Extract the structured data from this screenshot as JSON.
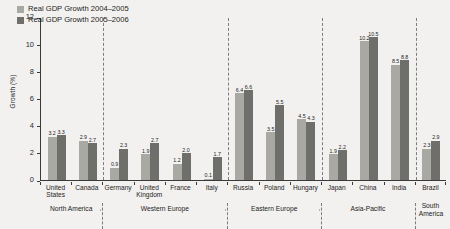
{
  "chart_data": {
    "type": "bar",
    "title": "",
    "xlabel": "",
    "ylabel": "Growth (%)",
    "ylim": [
      0,
      12
    ],
    "yticks": [
      "0",
      "2",
      "4",
      "6",
      "8",
      "10",
      "12"
    ],
    "grid": false,
    "legend_position": "top-left",
    "categories": [
      "United States",
      "Canada",
      "Germany",
      "United Kingdom",
      "France",
      "Italy",
      "Russia",
      "Poland",
      "Hungary",
      "Japan",
      "China",
      "India",
      "Brazil"
    ],
    "series": [
      {
        "name": "Real GDP Growth 2004-2005",
        "color": "#a9a9a4",
        "values": [
          3.2,
          2.9,
          0.9,
          1.9,
          1.2,
          0.1,
          6.4,
          3.5,
          4.5,
          1.9,
          10.2,
          8.5,
          2.3
        ]
      },
      {
        "name": "Real GDP Growth 2005-2006",
        "color": "#6e6e6b",
        "values": [
          3.3,
          2.7,
          2.3,
          2.7,
          2.0,
          1.7,
          6.6,
          5.5,
          4.3,
          2.2,
          10.5,
          8.8,
          2.9
        ]
      }
    ],
    "groups": [
      {
        "label": "North America",
        "count": 2
      },
      {
        "label": "Western Europe",
        "count": 4
      },
      {
        "label": "Eastern Europe",
        "count": 3
      },
      {
        "label": "Asia-Pacific",
        "count": 3
      },
      {
        "label": "South America",
        "count": 1
      }
    ]
  },
  "legend": {
    "items": [
      {
        "label": "Real GDP Growth 2004–2005"
      },
      {
        "label": "Real GDP Growth 2005–2006"
      }
    ]
  },
  "axes": {
    "y_title": "Growth (%)"
  },
  "colors": {
    "background": "#f2f1ef",
    "series_1": "#a9a9a4",
    "series_2": "#6e6e6b",
    "axis": "#3a3a3a",
    "separator": "#7d7d7d"
  }
}
